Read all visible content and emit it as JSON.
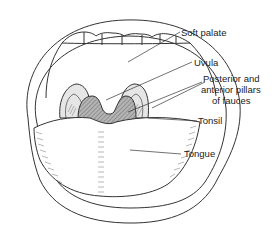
{
  "diagram": {
    "type": "anatomical-illustration",
    "labels": [
      {
        "id": "soft-palate",
        "text": "Soft palate"
      },
      {
        "id": "uvula",
        "text": "Uvula"
      },
      {
        "id": "pillars-line1",
        "text": "Posterior and"
      },
      {
        "id": "pillars-line2",
        "text": "anterior pillars"
      },
      {
        "id": "pillars-line3",
        "text": "of fauces"
      },
      {
        "id": "tonsil",
        "text": "Tonsil"
      },
      {
        "id": "tongue",
        "text": "Tongue"
      }
    ],
    "colors": {
      "line": "#333333",
      "uvula_fill": "#9a9a9a",
      "tonsil_fill": "#e2e2e2",
      "background": "#ffffff"
    }
  }
}
